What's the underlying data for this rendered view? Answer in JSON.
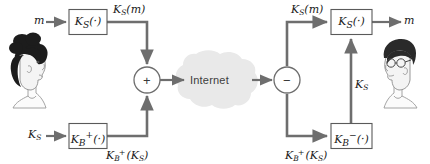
{
  "diagram": {
    "colors": {
      "line": "#6e6e6e",
      "box_stroke": "#5a5a5a",
      "box_fill": "#ffffff",
      "cloud_fill": "#e9e9e9",
      "text": "#1a1a1a",
      "hair": "#1c1c1c",
      "skin": "#f2f2f2",
      "background": "#ffffff"
    },
    "inputs": {
      "message_left": "m",
      "session_key_left": "K",
      "session_key_left_sub": "S"
    },
    "outputs": {
      "message_right": "m"
    },
    "boxes": [
      {
        "id": "encrypt-message",
        "base": "K",
        "sub": "S",
        "sup": "",
        "suffix": "(·)"
      },
      {
        "id": "encrypt-session-key",
        "base": "K",
        "sub": "B",
        "sup": "+",
        "suffix": "(·)"
      },
      {
        "id": "decrypt-message",
        "base": "K",
        "sub": "S",
        "sup": "",
        "suffix": "(·)"
      },
      {
        "id": "decrypt-session-key",
        "base": "K",
        "sub": "B",
        "sup": "−",
        "suffix": "(·)"
      }
    ],
    "edge_labels": {
      "encrypted_message_left": {
        "base": "K",
        "sub": "S",
        "arg": "(m)"
      },
      "encrypted_message_right": {
        "base": "K",
        "sub": "S",
        "arg": "(m)"
      },
      "encrypted_key_left": {
        "base": "K",
        "sub": "B",
        "sup": "+",
        "arg": "(K",
        "arg_sub": "S",
        "arg_close": ")"
      },
      "encrypted_key_right": {
        "base": "K",
        "sub": "B",
        "sup": "+",
        "arg": "(K",
        "arg_sub": "S",
        "arg_close": ")"
      },
      "recovered_session_key": {
        "base": "K",
        "sub": "S"
      }
    },
    "operators": {
      "combine": "+",
      "split": "−"
    },
    "network": {
      "label": "Internet"
    },
    "actors": [
      {
        "id": "sender",
        "description": "woman-with-updo-hair-facing-right"
      },
      {
        "id": "receiver",
        "description": "man-with-glasses-facing-left"
      }
    ]
  }
}
